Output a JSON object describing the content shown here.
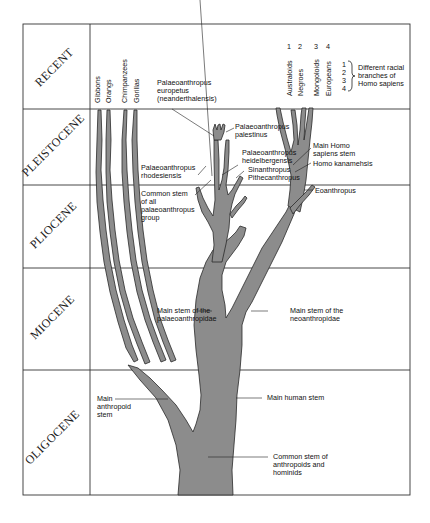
{
  "eras": [
    {
      "label": "RECENT"
    },
    {
      "label": "PLEISTOCENE"
    },
    {
      "label": "PLIOCENE"
    },
    {
      "label": "MIOCENE"
    },
    {
      "label": "OLIGOCENE"
    }
  ],
  "apes": [
    "Gibbons",
    "Orangs",
    "Chimpanzees",
    "Gorillas"
  ],
  "races": {
    "numbers": [
      "1",
      "2",
      "3",
      "4"
    ],
    "names": [
      "Australoids",
      "Negroes",
      "Mongoloids",
      "Europeans"
    ],
    "legend_numbers": [
      "1",
      "2",
      "3",
      "4"
    ],
    "legend_text": [
      "Different racial",
      "branches of",
      "Homo sapiens"
    ]
  },
  "labels": {
    "neanderthal": [
      "Palaeoanthropus",
      "europetus",
      "(neanderthalensis)"
    ],
    "palestinus": [
      "Palaeoanthropus",
      "palestinus"
    ],
    "heidelbergensis": [
      "Palaeoanthropus",
      "heidelbergensis"
    ],
    "sinanthropus": "Sinanthropus",
    "pithecanthropus": "Pithecanthropus",
    "rhodesiensis": [
      "Palaeoanthropus",
      "rhodesiensis"
    ],
    "common_palaeo": [
      "Common stem",
      "of all",
      "palaeoanthropus",
      "group"
    ],
    "main_homo": [
      "Main Homo",
      "sapiens stem"
    ],
    "kanamensis": "Homo kanamehsis",
    "eoanthropus": "Eoanthropus",
    "palaeo_stem": [
      "Main stem of the",
      "palaeoanthropidae"
    ],
    "neo_stem": [
      "Main stem of the",
      "neoanthropidae"
    ],
    "anthropoid_stem": [
      "Main",
      "anthropoid",
      "stem"
    ],
    "human_stem": "Main human stem",
    "common_stem": [
      "Common stem of",
      "anthropoids and",
      "hominids"
    ]
  },
  "colors": {
    "stem_fill": "#8c8c8c",
    "outline": "#2a2a2a",
    "grid": "#333333"
  }
}
